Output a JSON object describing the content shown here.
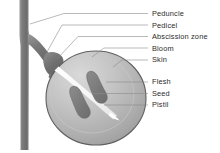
{
  "diagram": {
    "background_color": "#ffffff",
    "palette": {
      "stem_dark": "#6e6e6e",
      "stem_mid": "#8a8a8a",
      "stem_light": "#a5a5a5",
      "berry_outline": "#5a5a5a",
      "berry_fill_light": "#cfcfcf",
      "berry_fill_mid": "#b4b4b4",
      "berry_fill_dark": "#9c9c9c",
      "seed_fill": "#7d7d7d",
      "pistil_white": "#f6f6f6",
      "leader_line": "#8c8c8c",
      "label_text": "#2b2b2b"
    },
    "labels": [
      {
        "id": "peduncle",
        "text": "Peduncle",
        "text_x": 152,
        "text_y": 16,
        "leader": "M 148 13.5 L 64 13.5 L 30 24"
      },
      {
        "id": "pedicel",
        "text": "Pedicel",
        "text_x": 152,
        "text_y": 27.5,
        "leader": "M 148 25 L 62 25 L 47 52"
      },
      {
        "id": "abscission-zone",
        "text": "Abscission zone",
        "text_x": 152,
        "text_y": 39,
        "leader": "M 148 36.5 L 78 36.5 L 57 59"
      },
      {
        "id": "bloom",
        "text": "Bloom",
        "text_x": 152,
        "text_y": 50.5,
        "leader": "M 148 48 L 104 48 L 92 57"
      },
      {
        "id": "skin",
        "text": "Skin",
        "text_x": 152,
        "text_y": 62,
        "leader": "M 148 60 L 120 60 L 112 67"
      },
      {
        "id": "flesh",
        "text": "Flesh",
        "text_x": 152,
        "text_y": 84,
        "leader": "M 148 82 L 106 82"
      },
      {
        "id": "seed",
        "text": "Seed",
        "text_x": 152,
        "text_y": 95.5,
        "leader": "M 148 93.5 L 92 93.5"
      },
      {
        "id": "pistil",
        "text": "Pistil",
        "text_x": 152,
        "text_y": 107,
        "leader": "M 148 105 L 104 105"
      }
    ],
    "parts": {
      "peduncle_label": "Peduncle",
      "pedicel_label": "Pedicel",
      "abscission_label": "Abscission zone",
      "bloom_label": "Bloom",
      "skin_label": "Skin",
      "flesh_label": "Flesh",
      "seed_label": "Seed",
      "pistil_label": "Pistil"
    }
  }
}
